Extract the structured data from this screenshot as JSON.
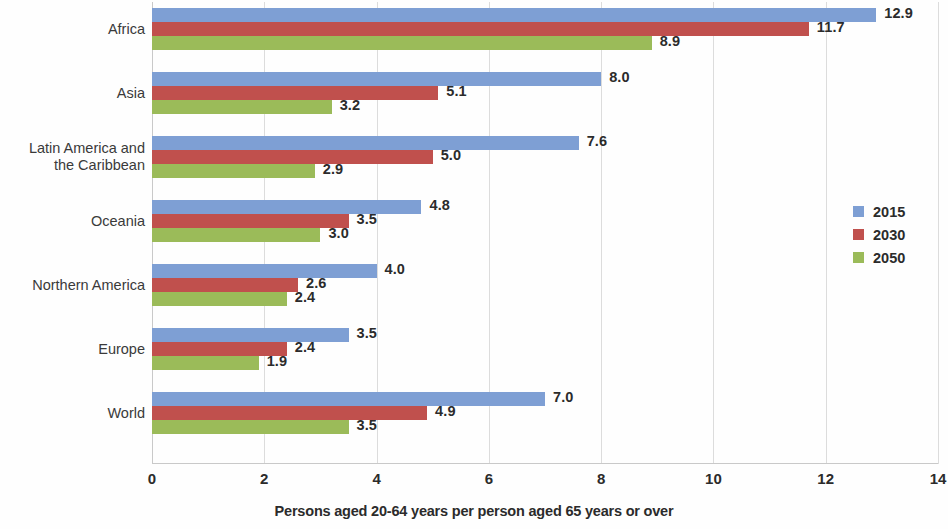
{
  "chart_data": {
    "type": "bar",
    "orientation": "horizontal",
    "title": "",
    "subtitle": "",
    "xlabel": "Persons aged 20-64 years per person aged 65 years or over",
    "ylabel": "",
    "xlim": [
      0,
      14
    ],
    "xticks": [
      0,
      2,
      4,
      6,
      8,
      10,
      12,
      14
    ],
    "xtick_labels": [
      "0",
      "2",
      "4",
      "6",
      "8",
      "10",
      "12",
      "14"
    ],
    "grid": true,
    "legend_position": "right",
    "categories": [
      "Africa",
      "Asia",
      "Latin America and\nthe Caribbean",
      "Oceania",
      "Northern America",
      "Europe",
      "World"
    ],
    "series": [
      {
        "name": "2015",
        "color": "#7e9fd4",
        "values": [
          12.9,
          8.0,
          7.6,
          4.8,
          4.0,
          3.5,
          7.0
        ],
        "value_labels": [
          "12.9",
          "8.0",
          "7.6",
          "4.8",
          "4.0",
          "3.5",
          "7.0"
        ]
      },
      {
        "name": "2030",
        "color": "#c0504d",
        "values": [
          11.7,
          5.1,
          5.0,
          3.5,
          2.6,
          2.4,
          4.9
        ],
        "value_labels": [
          "11.7",
          "5.1",
          "5.0",
          "3.5",
          "2.6",
          "2.4",
          "4.9"
        ]
      },
      {
        "name": "2050",
        "color": "#9bbb59",
        "values": [
          8.9,
          3.2,
          2.9,
          3.0,
          2.4,
          1.9,
          3.5
        ],
        "value_labels": [
          "8.9",
          "3.2",
          "2.9",
          "3.0",
          "2.4",
          "1.9",
          "3.5"
        ]
      }
    ]
  },
  "legend": {
    "items": [
      {
        "label": "2015",
        "color": "#7e9fd4"
      },
      {
        "label": "2030",
        "color": "#c0504d"
      },
      {
        "label": "2050",
        "color": "#9bbb59"
      }
    ]
  }
}
